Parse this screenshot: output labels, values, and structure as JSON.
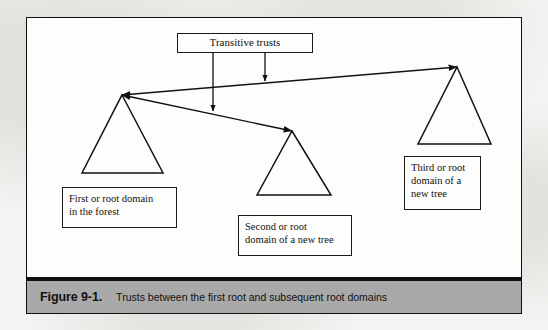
{
  "figure": {
    "caption_number": "Figure 9-1.",
    "caption_text": "Trusts between the first root and subsequent root domains",
    "frame_color": "#111111",
    "caption_bar_color": "#a9a9a9",
    "page_background": "#f4f3f1"
  },
  "diagram": {
    "type": "diagram",
    "title": "Trusts between the first root and subsequent root domains",
    "annotation_box": {
      "label": "Transitive trusts",
      "x": 177,
      "y": 33,
      "width": 136,
      "height": 20
    },
    "nodes": [
      {
        "id": "first-domain",
        "shape": "triangle",
        "apex": {
          "x": 122,
          "y": 95
        },
        "base_left": {
          "x": 82,
          "y": 173
        },
        "base_right": {
          "x": 163,
          "y": 173
        },
        "label_lines": [
          "First or root domain",
          "in the forest"
        ]
      },
      {
        "id": "second-domain",
        "shape": "triangle",
        "apex": {
          "x": 292,
          "y": 131
        },
        "base_left": {
          "x": 257,
          "y": 195
        },
        "base_right": {
          "x": 331,
          "y": 195
        },
        "label_lines": [
          "Second or root",
          "domain of a new tree"
        ]
      },
      {
        "id": "third-domain",
        "shape": "triangle",
        "apex": {
          "x": 457,
          "y": 67
        },
        "base_left": {
          "x": 418,
          "y": 144
        },
        "base_right": {
          "x": 491,
          "y": 144
        },
        "label_lines": [
          "Third or root",
          "domain of a",
          "new tree"
        ]
      }
    ],
    "trust_links": [
      {
        "id": "trust-first-to-third",
        "from": "first-domain",
        "to": "third-domain",
        "bidirectional": true,
        "x1": 122,
        "y1": 95,
        "x2": 457,
        "y2": 67
      },
      {
        "id": "trust-first-to-second",
        "from": "first-domain",
        "to": "second-domain",
        "bidirectional": true,
        "x1": 122,
        "y1": 95,
        "x2": 292,
        "y2": 131
      }
    ],
    "annotation_pointers": [
      {
        "id": "pointer-to-lower-trust",
        "x": 213,
        "y1": 53,
        "y2": 111
      },
      {
        "id": "pointer-to-upper-trust",
        "x": 265,
        "y1": 53,
        "y2": 81
      }
    ]
  }
}
